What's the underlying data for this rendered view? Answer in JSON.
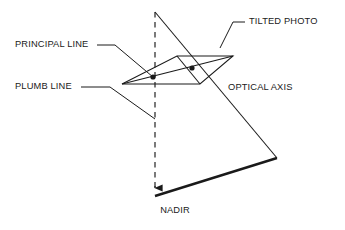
{
  "diagram": {
    "background_color": "#ffffff",
    "stroke_color": "#1a1a1a",
    "text_color": "#1a1a1a",
    "labels": {
      "principal_line": "PRINCIPAL LINE",
      "plumb_line": "PLUMB LINE",
      "tilted_photo": "TILTED PHOTO",
      "optical_axis": "OPTICAL AXIS",
      "nadir": "NADIR"
    },
    "geometry": {
      "plumb_line": {
        "x": 155,
        "y_top": 12,
        "y_bottom": 196,
        "style": "dashed",
        "arrow": "down"
      },
      "optical_axis": {
        "x1": 155,
        "y1": 12,
        "x2": 277,
        "y2": 158
      },
      "exposure_station": {
        "x": 155,
        "y": 12
      },
      "photo_plane": [
        {
          "x": 122,
          "y": 84
        },
        {
          "x": 177,
          "y": 56
        },
        {
          "x": 233,
          "y": 56
        },
        {
          "x": 200,
          "y": 84
        }
      ],
      "principal_point": {
        "x": 192,
        "y": 68
      },
      "nadir_point_on_photo": {
        "x": 153,
        "y": 77
      },
      "ground_line": {
        "x1": 155,
        "y1": 196,
        "x2": 277,
        "y2": 158
      },
      "nadir_arrow_tip": {
        "x": 155,
        "y": 196
      }
    },
    "leaders": {
      "principal_line": [
        [
          115,
          45
        ],
        [
          153,
          77
        ]
      ],
      "plumb_line": [
        [
          88,
          87
        ],
        [
          122,
          87
        ],
        [
          155,
          119
        ]
      ],
      "tilted_photo": [
        [
          232,
          22
        ],
        [
          243,
          22
        ],
        [
          221,
          47
        ]
      ]
    },
    "text_positions": {
      "principal_line": {
        "x": 15,
        "y": 45,
        "anchor": "start"
      },
      "plumb_line": {
        "x": 15,
        "y": 87,
        "anchor": "start"
      },
      "tilted_photo": {
        "x": 248,
        "y": 22,
        "anchor": "start"
      },
      "optical_axis": {
        "x": 228,
        "y": 88,
        "anchor": "start"
      },
      "nadir": {
        "x": 175,
        "y": 211,
        "anchor": "middle"
      }
    }
  }
}
